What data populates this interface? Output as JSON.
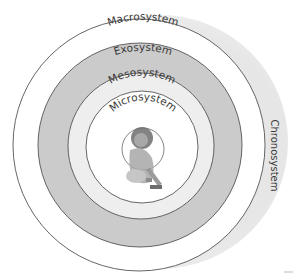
{
  "diagram": {
    "type": "concentric-systems",
    "layers": [
      {
        "id": "chronosystem",
        "label": "Chronosystem",
        "fill": "#e4e4e4"
      },
      {
        "id": "macrosystem",
        "label": "Macrosystem",
        "fill": "#ffffff"
      },
      {
        "id": "exosystem",
        "label": "Exosystem",
        "fill": "#cbcbcb"
      },
      {
        "id": "mesosystem",
        "label": "Mesosystem",
        "fill": "#efefef"
      },
      {
        "id": "microsystem",
        "label": "Microsystem",
        "fill": "#ffffff"
      }
    ],
    "center_figure": "child-playing"
  }
}
